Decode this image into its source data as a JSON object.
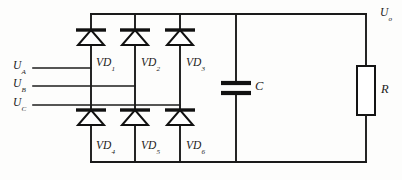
{
  "diagram": {
    "type": "circuit-schematic",
    "line_color": "#1a1a1a",
    "background_color": "#fdfdfc"
  },
  "sources": [
    {
      "id": "ua",
      "symbol": "U",
      "subscript": "A",
      "label": "Uₐ"
    },
    {
      "id": "ub",
      "symbol": "U",
      "subscript": "B",
      "label": "Uʙ"
    },
    {
      "id": "uc",
      "symbol": "U",
      "subscript": "C",
      "label": "Uꟲ"
    }
  ],
  "diodes_top": [
    {
      "id": "vd1",
      "symbol": "VD",
      "subscript": "1"
    },
    {
      "id": "vd2",
      "symbol": "VD",
      "subscript": "2"
    },
    {
      "id": "vd3",
      "symbol": "VD",
      "subscript": "3"
    }
  ],
  "diodes_bottom": [
    {
      "id": "vd4",
      "symbol": "VD",
      "subscript": "4"
    },
    {
      "id": "vd5",
      "symbol": "VD",
      "subscript": "5"
    },
    {
      "id": "vd6",
      "symbol": "VD",
      "subscript": "6"
    }
  ],
  "components": {
    "capacitor": {
      "symbol": "C",
      "subscript": ""
    },
    "resistor": {
      "symbol": "R",
      "subscript": ""
    }
  },
  "output": {
    "symbol": "U",
    "subscript": "o"
  }
}
